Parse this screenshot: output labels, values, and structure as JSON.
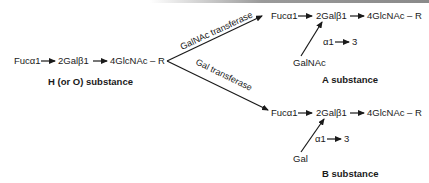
{
  "diagram": {
    "h_substance": {
      "label": "H (or O) substance",
      "fuc": "Fucα1",
      "gal": "2Galβ1",
      "glc": "4GlcNAc – R"
    },
    "a_branch": {
      "enzyme": "GalNAc transferase",
      "fuc": "Fucα1",
      "gal": "2Galβ1",
      "glc": "4GlcNAc – R",
      "linkage_alpha": "α1",
      "linkage_pos": "3",
      "added_sugar": "GalNAc",
      "label": "A substance"
    },
    "b_branch": {
      "enzyme": "Gal transferase",
      "fuc": "Fucα1",
      "gal": "2Galβ1",
      "glc": "4GlcNAc – R",
      "linkage_alpha": "α1",
      "linkage_pos": "3",
      "added_sugar": "Gal",
      "label": "B substance"
    }
  }
}
